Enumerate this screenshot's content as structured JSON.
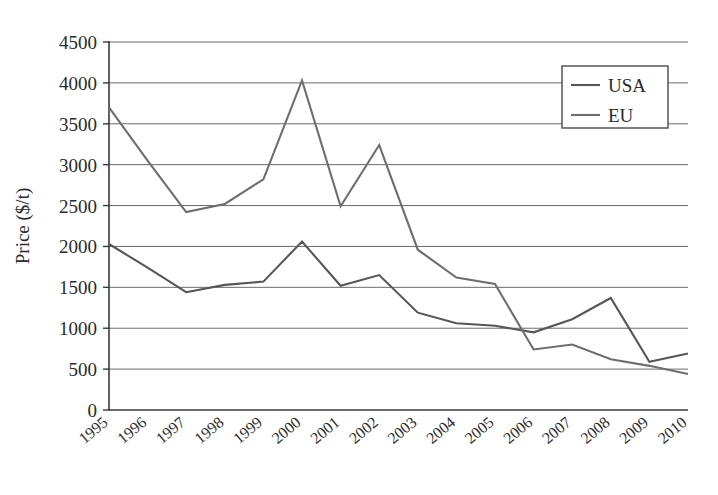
{
  "chart_data": {
    "type": "line",
    "title": "",
    "xlabel": "",
    "ylabel": "Price ($/t)",
    "categories": [
      "1995",
      "1996",
      "1997",
      "1998",
      "1999",
      "2000",
      "2001",
      "2002",
      "2003",
      "2004",
      "2005",
      "2006",
      "2007",
      "2008",
      "2009",
      "2010"
    ],
    "ylim": [
      0,
      4500
    ],
    "ytick_step": 500,
    "yticks": [
      "0",
      "500",
      "1000",
      "1500",
      "2000",
      "2500",
      "3000",
      "3500",
      "4000",
      "4500"
    ],
    "grid": true,
    "legend_position": "top-right",
    "series": [
      {
        "name": "USA",
        "color": "#575757",
        "values": [
          2030,
          1740,
          1440,
          1530,
          1570,
          2060,
          1520,
          1650,
          1190,
          1060,
          1030,
          950,
          1110,
          1370,
          590,
          690
        ]
      },
      {
        "name": "EU",
        "color": "#6e6e6e",
        "values": [
          3700,
          3050,
          2420,
          2520,
          2820,
          4030,
          2490,
          3240,
          1960,
          1620,
          1540,
          740,
          800,
          620,
          540,
          440
        ]
      }
    ]
  },
  "legend": {
    "entries": [
      {
        "label": "USA"
      },
      {
        "label": "EU"
      }
    ]
  },
  "axes": {
    "y_title": "Price ($/t)"
  }
}
